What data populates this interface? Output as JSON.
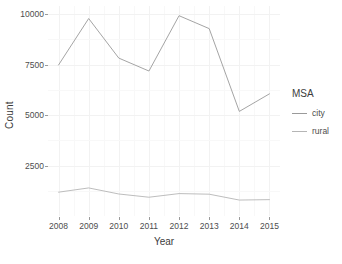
{
  "chart_data": {
    "type": "line",
    "title": "",
    "xlabel": "Year",
    "ylabel": "Count",
    "x": [
      2008,
      2009,
      2010,
      2011,
      2012,
      2013,
      2014,
      2015
    ],
    "categories": [
      "2008",
      "2009",
      "2010",
      "2011",
      "2012",
      "2013",
      "2014",
      "2015"
    ],
    "series": [
      {
        "name": "city",
        "color": "#9a9a9a",
        "values": [
          7480,
          9780,
          7820,
          7180,
          9920,
          9280,
          5180,
          6050
        ]
      },
      {
        "name": "rural",
        "color": "#b5b5b5",
        "values": [
          1180,
          1390,
          1090,
          930,
          1110,
          1080,
          790,
          810
        ]
      }
    ],
    "ylim": [
      0,
      10400
    ],
    "xlim": [
      2007.65,
      2015.35
    ],
    "yticks": [
      2500,
      5000,
      7500,
      10000
    ],
    "ytick_labels": [
      "2500",
      "5000",
      "7500",
      "10000"
    ],
    "xticks": [
      2008,
      2009,
      2010,
      2011,
      2012,
      2013,
      2014,
      2015
    ],
    "grid": true,
    "legend": {
      "title": "MSA",
      "position": "right",
      "entries": [
        {
          "label": "city",
          "color": "#9a9a9a"
        },
        {
          "label": "rural",
          "color": "#b5b5b5"
        }
      ]
    }
  }
}
